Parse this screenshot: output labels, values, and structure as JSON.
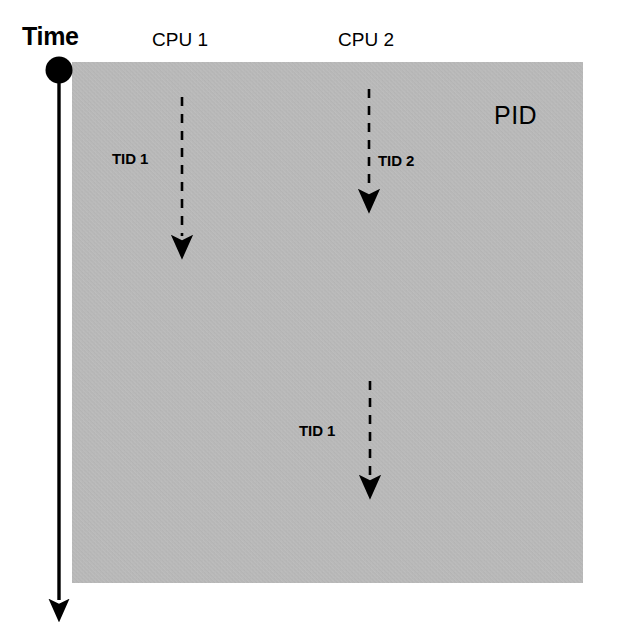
{
  "diagram": {
    "title_label": "Time",
    "process_label": "PID",
    "columns": [
      {
        "id": "cpu1",
        "label": "CPU 1"
      },
      {
        "id": "cpu2",
        "label": "CPU 2"
      }
    ],
    "threads": [
      {
        "id": "thread-cpu1-tid1",
        "label": "TID 1",
        "column": "cpu1",
        "label_side": "left"
      },
      {
        "id": "thread-cpu2-tid2",
        "label": "TID 2",
        "column": "cpu2",
        "label_side": "right"
      },
      {
        "id": "thread-cpu2-tid1",
        "label": "TID 1",
        "column": "cpu2",
        "label_side": "left"
      }
    ],
    "colors": {
      "box_fill": "#bfbfbf",
      "stroke": "#000000",
      "background": "#ffffff"
    }
  }
}
